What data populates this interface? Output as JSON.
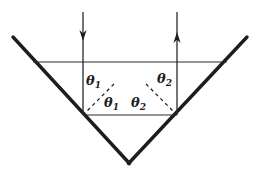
{
  "figure": {
    "background_color": "#ffffff",
    "stroke_color": "#1d1d1d",
    "width": 261,
    "height": 175
  },
  "labels": [
    {
      "id": "theta-1-upper",
      "symbol": "θ",
      "subscript": "1",
      "x": 86,
      "y": 84
    },
    {
      "id": "theta-1-lower",
      "symbol": "θ",
      "subscript": "1",
      "x": 104,
      "y": 106
    },
    {
      "id": "theta-2-upper",
      "symbol": "θ",
      "subscript": "2",
      "x": 158,
      "y": 82
    },
    {
      "id": "theta-2-lower",
      "symbol": "θ",
      "subscript": "2",
      "x": 132,
      "y": 106
    }
  ],
  "mirror": {
    "name": "v-shaped-mirror",
    "left_arm": {
      "x1": 13,
      "y1": 37,
      "x2": 129,
      "y2": 163
    },
    "right_arm": {
      "x1": 129,
      "y1": 163,
      "x2": 247,
      "y2": 37
    },
    "stroke_width": 3.4
  },
  "reference_lines": [
    {
      "id": "upper-horizontal-line",
      "x1": 33,
      "y1": 62,
      "x2": 227,
      "y2": 62
    },
    {
      "id": "lower-horizontal-line",
      "x1": 83,
      "y1": 115,
      "x2": 177,
      "y2": 115
    }
  ],
  "rays": [
    {
      "id": "incoming-ray",
      "direction": "down",
      "x": 83,
      "y_start": 12,
      "y_end": 115,
      "arrow_tip_y": 40
    },
    {
      "id": "outgoing-ray",
      "direction": "up",
      "x": 177,
      "y_start": 115,
      "y_end": 12,
      "arrow_tip_y": 33
    },
    {
      "id": "internal-ray",
      "direction": "right",
      "x1": 83,
      "y1": 115,
      "x2": 177,
      "y2": 115
    }
  ],
  "normals": [
    {
      "id": "left-normal-dashed",
      "x1": 113,
      "y1": 85,
      "x2": 85,
      "y2": 113,
      "dash": "3,3"
    },
    {
      "id": "right-normal-dashed",
      "x1": 147,
      "y1": 85,
      "x2": 175,
      "y2": 113,
      "dash": "3,3"
    }
  ]
}
